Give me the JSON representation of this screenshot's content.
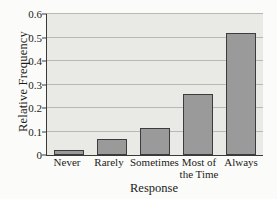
{
  "chart_data": {
    "type": "bar",
    "title": "",
    "xlabel": "Response",
    "ylabel": "Relative Frequency",
    "categories": [
      "Never",
      "Rarely",
      "Sometimes",
      "Most of the Time",
      "Always"
    ],
    "category_lines": [
      [
        "Never"
      ],
      [
        "Rarely"
      ],
      [
        "Sometimes"
      ],
      [
        "Most of",
        "the Time"
      ],
      [
        "Always"
      ]
    ],
    "values": [
      0.02,
      0.07,
      0.115,
      0.26,
      0.52
    ],
    "ylim": [
      0,
      0.6
    ],
    "yticks": [
      0,
      0.1,
      0.2,
      0.3,
      0.4,
      0.5,
      0.6
    ],
    "ytick_labels": [
      "0",
      "0.1",
      "0.2",
      "0.3",
      "0.4",
      "0.5",
      "0.6"
    ],
    "grid": true,
    "legend": false,
    "colors": {
      "bar_fill": "#9a9a9a",
      "bar_edge": "#3c3c3c",
      "plot_background": "#e9e9e6",
      "gridline": "#b9b9b4",
      "axis": "#3a3a3a",
      "text": "#1b1b1b",
      "page_background": "#fbfbf9"
    }
  }
}
